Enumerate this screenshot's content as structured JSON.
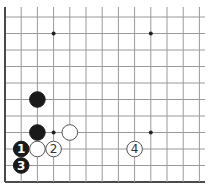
{
  "diagram": {
    "type": "go-board-fragment",
    "grid": {
      "columns": 13,
      "rows": 11,
      "origin_x": 5,
      "origin_y": 17,
      "spacing_x": 16.2,
      "spacing_y": 16.5,
      "left_edge": true,
      "bottom_edge": true,
      "top_edge": false,
      "right_edge": false
    },
    "colors": {
      "line": "#9a9a9a",
      "edge": "#4a4a4a",
      "black_stone": "#1a1a1a",
      "white_stone": "#ffffff"
    },
    "star_points": [
      {
        "col": 3,
        "row": 1
      },
      {
        "col": 9,
        "row": 1
      },
      {
        "col": 3,
        "row": 7
      },
      {
        "col": 9,
        "row": 7
      }
    ],
    "stones": [
      {
        "color": "black",
        "col": 2,
        "row": 5,
        "label": ""
      },
      {
        "color": "black",
        "col": 2,
        "row": 7,
        "label": ""
      },
      {
        "color": "white",
        "col": 4,
        "row": 7,
        "label": ""
      },
      {
        "color": "black",
        "col": 1,
        "row": 8,
        "label": "1"
      },
      {
        "color": "white",
        "col": 2,
        "row": 8,
        "label": ""
      },
      {
        "color": "white",
        "col": 3,
        "row": 8,
        "label": "2"
      },
      {
        "color": "white",
        "col": 8,
        "row": 8,
        "label": "4"
      },
      {
        "color": "black",
        "col": 1,
        "row": 9,
        "label": "3"
      }
    ]
  }
}
